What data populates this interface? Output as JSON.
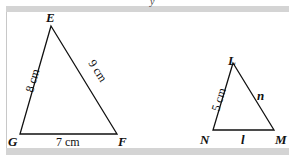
{
  "top_mark": "y",
  "triangles": [
    {
      "name": "EFG",
      "vertices": {
        "E": "E",
        "F": "F",
        "G": "G"
      },
      "sides": {
        "GE": "8 cm",
        "EF": "9 cm",
        "GF": "7 cm"
      }
    },
    {
      "name": "LMN",
      "vertices": {
        "L": "L",
        "M": "M",
        "N": "N"
      },
      "sides": {
        "NL": "5 cm",
        "LM": "n",
        "NM": "l"
      }
    }
  ],
  "colors": {
    "line": "#111111",
    "bar": "#d4d4d4"
  }
}
